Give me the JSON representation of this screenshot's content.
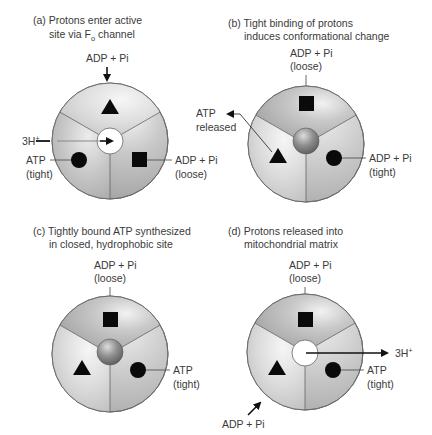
{
  "colors": {
    "text": "#3a3a3a",
    "line": "#555555",
    "shape": "#0a0a0a",
    "outline": "#6a6a6a"
  },
  "panels": [
    {
      "id": "a",
      "title_line1": "(a) Protons enter active",
      "title_line2": "site via F",
      "title_sub": "o",
      "title_line2_end": " channel",
      "labels": {
        "top": "ADP + Pi",
        "left_in": "3H",
        "left_in_sup": "+",
        "left_bottom_1": "ATP",
        "left_bottom_2": "(tight)",
        "right_1": "ADP + Pi",
        "right_2": "(loose)"
      }
    },
    {
      "id": "b",
      "title_line1": "(b) Tight binding of protons",
      "title_line2": "induces conformational change",
      "labels": {
        "top_1": "ADP + Pi",
        "top_2": "(loose)",
        "released_1": "ATP",
        "released_2": "released",
        "right_1": "ADP + Pi",
        "right_2": "(tight)"
      }
    },
    {
      "id": "c",
      "title_line1": "(c) Tightly bound ATP synthesized",
      "title_line2": "in closed, hydrophobic site",
      "labels": {
        "top_1": "ADP + Pi",
        "top_2": "(loose)",
        "right_1": "ATP",
        "right_2": "(tight)"
      }
    },
    {
      "id": "d",
      "title_line1": "(d) Protons released into",
      "title_line2": "mitochondrial matrix",
      "labels": {
        "top_1": "ADP + Pi",
        "top_2": "(loose)",
        "out": "3H",
        "out_sup": "+",
        "right_1": "ATP",
        "right_2": "(tight)",
        "bottom_in": "ADP + Pi"
      }
    }
  ]
}
